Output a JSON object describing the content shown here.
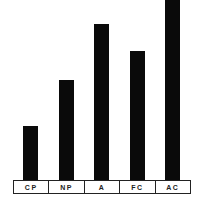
{
  "chart_data": {
    "type": "bar",
    "title": "",
    "xlabel": "",
    "ylabel": "",
    "categories": [
      "CP",
      "NP",
      "A",
      "FC",
      "AC"
    ],
    "values": [
      54,
      100,
      156,
      129,
      180
    ],
    "value_units": "relative bar height (px, no axis shown)",
    "ylim": [
      0,
      180
    ],
    "grid": false,
    "legend": null,
    "bar_color": "#0a0a0a"
  },
  "labels": [
    "CP",
    "NP",
    "A",
    "FC",
    "AC"
  ]
}
